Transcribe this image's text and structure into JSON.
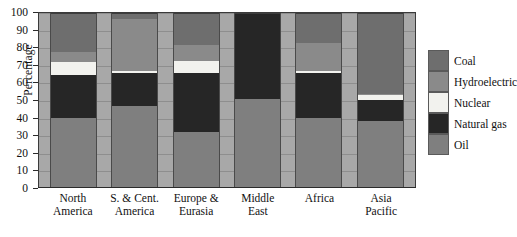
{
  "chart_data": {
    "type": "bar",
    "subtype": "stacked-100-percent",
    "title": "",
    "xlabel": "",
    "ylabel": "Percentage",
    "ylim": [
      0,
      100
    ],
    "ytick_values": [
      0,
      10,
      20,
      30,
      40,
      50,
      60,
      70,
      80,
      90,
      100
    ],
    "grid": true,
    "legend_position": "right",
    "categories": [
      "North America",
      "S. & Cent. America",
      "Europe & Eurasia",
      "Middle East",
      "Africa",
      "Asia Pacific"
    ],
    "category_lines": [
      [
        "North",
        "America"
      ],
      [
        "S. & Cent.",
        "America"
      ],
      [
        "Europe &",
        "Eurasia"
      ],
      [
        "Middle",
        "East"
      ],
      [
        "Africa",
        ""
      ],
      [
        "Asia",
        "Pacific"
      ]
    ],
    "series": [
      {
        "name": "Oil",
        "color": "#7f7f7f",
        "values": [
          40,
          47,
          32,
          51,
          40,
          38
        ]
      },
      {
        "name": "Natural gas",
        "color": "#262626",
        "values": [
          25,
          19,
          34,
          49,
          26,
          12
        ]
      },
      {
        "name": "Nuclear",
        "color": "#f2f2ee",
        "values": [
          7,
          1,
          7,
          0,
          1,
          3
        ]
      },
      {
        "name": "Hydroelectric",
        "color": "#8a8a8a",
        "values": [
          6,
          30,
          9,
          0,
          16,
          1
        ]
      },
      {
        "name": "Coal",
        "color": "#6e6e6e",
        "values": [
          22,
          3,
          18,
          0,
          17,
          46
        ]
      }
    ],
    "stack_order_bottom_to_top": [
      "Oil",
      "Natural gas",
      "Nuclear",
      "Hydroelectric",
      "Coal"
    ]
  },
  "legend": {
    "items": [
      {
        "label": "Coal",
        "key": "coal"
      },
      {
        "label": "Hydroelectric",
        "key": "hydro"
      },
      {
        "label": "Nuclear",
        "key": "nuclear"
      },
      {
        "label": "Natural gas",
        "key": "gas"
      },
      {
        "label": "Oil",
        "key": "oil"
      }
    ]
  },
  "colors": {
    "coal": "#6e6e6e",
    "hydroelectric": "#8a8a8a",
    "nuclear": "#f2f2ee",
    "natural_gas": "#262626",
    "oil": "#7f7f7f",
    "plot_background": "#a8a8a8",
    "axis": "#2b2b2b",
    "page_background": "#ffffff"
  }
}
